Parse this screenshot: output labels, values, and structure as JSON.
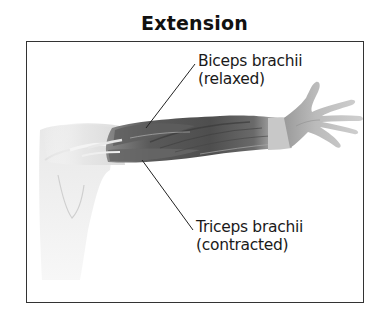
{
  "title": "Extension",
  "labels": {
    "biceps": {
      "name": "Biceps brachii",
      "state": "(relaxed)"
    },
    "triceps": {
      "name": "Triceps brachii",
      "state": "(contracted)"
    }
  },
  "colors": {
    "frame": "#333333",
    "muscle_dark": "#4a4a4a",
    "muscle_mid": "#7a7a7a",
    "skin_light": "#dcdcdc",
    "leader_line": "#222222"
  }
}
